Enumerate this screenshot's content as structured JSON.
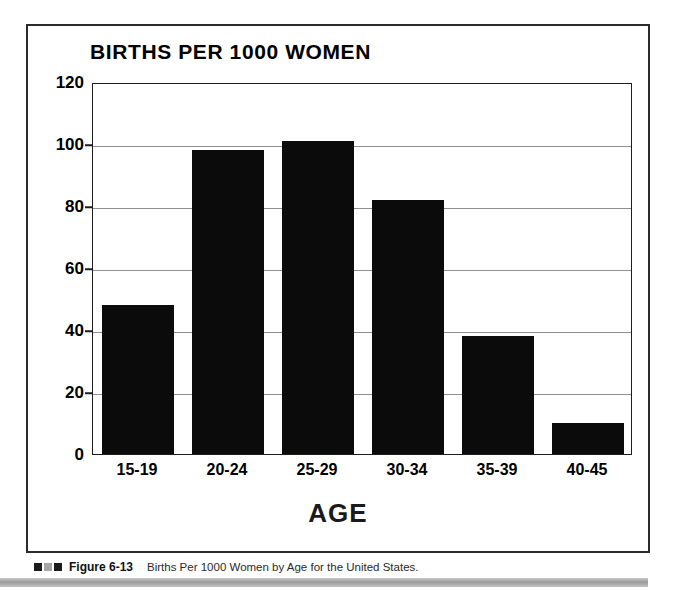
{
  "figure": {
    "caption_figure_number": "Figure 6-13",
    "caption_text": "Births Per 1000 Women by Age for the United States.",
    "marker_colors": [
      "#1b1b1b",
      "#a6a6a6",
      "#1b1b1b"
    ]
  },
  "chart_data": {
    "type": "bar",
    "title": "BIRTHS PER 1000 WOMEN",
    "xlabel": "AGE",
    "ylabel": "",
    "categories": [
      "15-19",
      "20-24",
      "25-29",
      "30-34",
      "35-39",
      "40-45"
    ],
    "values": [
      48,
      98,
      101,
      82,
      38,
      10
    ],
    "ylim": [
      0,
      120
    ],
    "yticks": [
      0,
      20,
      40,
      60,
      80,
      100,
      120
    ],
    "ytick_labels": [
      "0",
      "20",
      "40",
      "60",
      "80",
      "100",
      "120"
    ],
    "grid": true,
    "legend": "none",
    "bar_color": "#0b0b0b"
  }
}
